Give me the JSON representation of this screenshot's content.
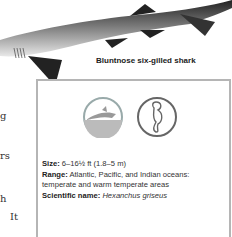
{
  "image": {
    "subject": "shark-illustration"
  },
  "caption": "Bluntnose six-gilled shark",
  "left_column_fragments": [
    "g",
    "rs",
    "h",
    "It"
  ],
  "factbox": {
    "icons": [
      "ocean-habitat-icon",
      "seahorse-icon"
    ],
    "size_label": "Size:",
    "size_value": " 6–16½ ft (1.8–5 m)",
    "range_label": "Range:",
    "range_value": " Atlantic, Pacific, and Indian oceans: temperate and warm temperate areas",
    "sci_label": "Scientific name:",
    "sci_value": "Hexanchus griseus"
  }
}
